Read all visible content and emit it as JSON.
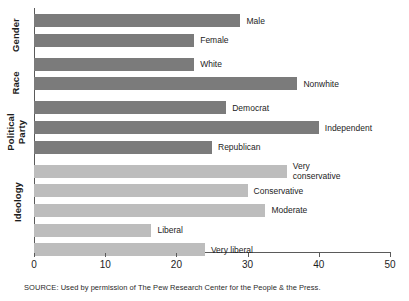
{
  "source": {
    "text": "SOURCE: Used by permission of The Pew Research Center for the People & the Press."
  },
  "colors": {
    "bar_dark": "#7b7b7b",
    "bar_light": "#bdbdbd",
    "axis": "#5a5a5a",
    "text": "#1d1d1d",
    "background": "#ffffff"
  },
  "groups": [
    {
      "label": "Gender"
    },
    {
      "label": "Race"
    },
    {
      "label": "Political\nParty"
    },
    {
      "label": "Ideology"
    }
  ],
  "group_labels": {
    "gender": "Gender",
    "race": "Race",
    "political_party_line1": "Political",
    "political_party_line2": "Party",
    "ideology": "Ideology"
  },
  "chart_data": {
    "type": "bar",
    "orientation": "horizontal",
    "title": "",
    "subtitle": "",
    "xlabel": "",
    "ylabel": "",
    "xlim": [
      0,
      50
    ],
    "xticks": [
      0,
      10,
      20,
      30,
      40,
      50
    ],
    "xtick_labels": [
      "0",
      "10",
      "20",
      "30",
      "40",
      "50"
    ],
    "grid": false,
    "legend": "none",
    "categories": [
      "Male",
      "Female",
      "White",
      "Nonwhite",
      "Democrat",
      "Independent",
      "Republican",
      "Very conservative",
      "Conservative",
      "Moderate",
      "Liberal",
      "Very liberal"
    ],
    "values": [
      29,
      22.5,
      22.5,
      37,
      27,
      40,
      25,
      35.5,
      30,
      32.5,
      16.5,
      24
    ],
    "groups": [
      "Gender",
      "Gender",
      "Race",
      "Race",
      "Political Party",
      "Political Party",
      "Political Party",
      "Ideology",
      "Ideology",
      "Ideology",
      "Ideology",
      "Ideology"
    ],
    "series": [
      {
        "name": "Percent",
        "values": [
          29,
          22.5,
          22.5,
          37,
          27,
          40,
          25,
          35.5,
          30,
          32.5,
          16.5,
          24
        ]
      }
    ],
    "bars": [
      {
        "label": "Male",
        "value": 29,
        "shade": "dark",
        "wrap": false
      },
      {
        "label": "Female",
        "value": 22.5,
        "shade": "dark",
        "wrap": false
      },
      {
        "label": "White",
        "value": 22.5,
        "shade": "dark",
        "wrap": false
      },
      {
        "label": "Nonwhite",
        "value": 37,
        "shade": "dark",
        "wrap": false
      },
      {
        "label": "Democrat",
        "value": 27,
        "shade": "dark",
        "wrap": false
      },
      {
        "label": "Independent",
        "value": 40,
        "shade": "dark",
        "wrap": false
      },
      {
        "label": "Republican",
        "value": 25,
        "shade": "dark",
        "wrap": false
      },
      {
        "label": "Very conservative",
        "value": 35.5,
        "shade": "light",
        "wrap": true
      },
      {
        "label": "Conservative",
        "value": 30,
        "shade": "light",
        "wrap": false
      },
      {
        "label": "Moderate",
        "value": 32.5,
        "shade": "light",
        "wrap": false
      },
      {
        "label": "Liberal",
        "value": 16.5,
        "shade": "light",
        "wrap": false
      },
      {
        "label": "Very liberal",
        "value": 24,
        "shade": "light",
        "wrap": false
      }
    ]
  }
}
